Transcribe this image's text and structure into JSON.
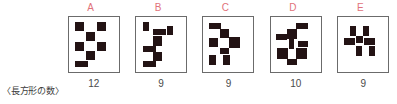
{
  "caption": {
    "row_label": "〈長方形の数〉"
  },
  "colors": {
    "label": "#e1727a",
    "block": "#231314",
    "border": "#6b6b6b",
    "text": "#4a4a4a",
    "background": "#ffffff"
  },
  "panels": [
    {
      "label": "A",
      "count": "12",
      "blocks": [
        {
          "x": 1,
          "y": 0,
          "w": 9,
          "h": 9
        },
        {
          "x": 23,
          "y": 0,
          "w": 9,
          "h": 9
        },
        {
          "x": 12,
          "y": 10,
          "w": 9,
          "h": 9
        },
        {
          "x": 1,
          "y": 20,
          "w": 9,
          "h": 9
        },
        {
          "x": 23,
          "y": 20,
          "w": 9,
          "h": 9
        },
        {
          "x": 12,
          "y": 29,
          "w": 9,
          "h": 9
        },
        {
          "x": 1,
          "y": 39,
          "w": 13,
          "h": 6
        }
      ]
    },
    {
      "label": "B",
      "count": "9",
      "blocks": [
        {
          "x": 2,
          "y": 0,
          "w": 6,
          "h": 9
        },
        {
          "x": 26,
          "y": 4,
          "w": 6,
          "h": 9
        },
        {
          "x": 12,
          "y": 7,
          "w": 13,
          "h": 6
        },
        {
          "x": 12,
          "y": 14,
          "w": 9,
          "h": 10
        },
        {
          "x": 2,
          "y": 24,
          "w": 13,
          "h": 6
        },
        {
          "x": 12,
          "y": 30,
          "w": 9,
          "h": 9
        },
        {
          "x": 2,
          "y": 39,
          "w": 13,
          "h": 6
        }
      ]
    },
    {
      "label": "C",
      "count": "9",
      "blocks": [
        {
          "x": 1,
          "y": 1,
          "w": 12,
          "h": 6
        },
        {
          "x": 12,
          "y": 7,
          "w": 9,
          "h": 9
        },
        {
          "x": 1,
          "y": 16,
          "w": 9,
          "h": 9
        },
        {
          "x": 21,
          "y": 15,
          "w": 11,
          "h": 11
        },
        {
          "x": 12,
          "y": 26,
          "w": 9,
          "h": 6
        },
        {
          "x": 1,
          "y": 33,
          "w": 7,
          "h": 10
        },
        {
          "x": 15,
          "y": 33,
          "w": 7,
          "h": 10
        }
      ]
    },
    {
      "label": "D",
      "count": "10",
      "blocks": [
        {
          "x": 20,
          "y": 1,
          "w": 12,
          "h": 6
        },
        {
          "x": 11,
          "y": 7,
          "w": 10,
          "h": 10
        },
        {
          "x": 0,
          "y": 12,
          "w": 11,
          "h": 6
        },
        {
          "x": 13,
          "y": 17,
          "w": 5,
          "h": 10
        },
        {
          "x": 22,
          "y": 19,
          "w": 10,
          "h": 6
        },
        {
          "x": 1,
          "y": 26,
          "w": 11,
          "h": 11
        },
        {
          "x": 20,
          "y": 26,
          "w": 11,
          "h": 11
        },
        {
          "x": 11,
          "y": 37,
          "w": 10,
          "h": 6
        }
      ]
    },
    {
      "label": "E",
      "count": "9",
      "blocks": [
        {
          "x": 7,
          "y": 4,
          "w": 6,
          "h": 10
        },
        {
          "x": 20,
          "y": 4,
          "w": 6,
          "h": 10
        },
        {
          "x": 1,
          "y": 16,
          "w": 11,
          "h": 7
        },
        {
          "x": 13,
          "y": 14,
          "w": 7,
          "h": 7
        },
        {
          "x": 21,
          "y": 16,
          "w": 11,
          "h": 7
        },
        {
          "x": 13,
          "y": 24,
          "w": 6,
          "h": 10
        },
        {
          "x": 26,
          "y": 24,
          "w": 6,
          "h": 10
        }
      ]
    }
  ]
}
